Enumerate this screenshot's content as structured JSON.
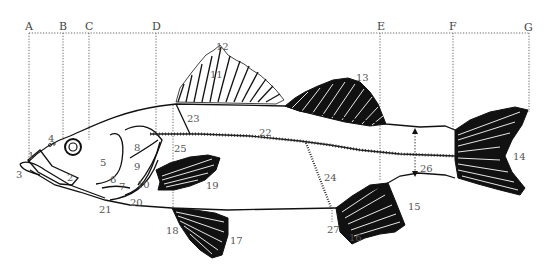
{
  "figure": {
    "background": "#ffffff",
    "line_color": "#111111",
    "label_color": "#555555"
  },
  "reference_lines": [
    {
      "id": "A",
      "label": "A"
    },
    {
      "id": "B",
      "label": "B"
    },
    {
      "id": "C",
      "label": "C"
    },
    {
      "id": "D",
      "label": "D"
    },
    {
      "id": "E",
      "label": "E"
    },
    {
      "id": "F",
      "label": "F"
    },
    {
      "id": "G",
      "label": "G"
    }
  ],
  "labels": {
    "n1": "1",
    "n2": "2",
    "n3": "3",
    "n4": "4",
    "n5": "5",
    "n6": "6",
    "n7": "7",
    "n8": "8",
    "n9": "9",
    "n10": "10",
    "n11": "11",
    "n12": "12",
    "n13": "13",
    "n14": "14",
    "n15": "15",
    "n16": "16",
    "n17": "17",
    "n18": "18",
    "n19": "19",
    "n20": "20",
    "n21": "21",
    "n22": "22",
    "n23": "23",
    "n24": "24",
    "n25": "25",
    "n26": "26",
    "n27": "27"
  }
}
